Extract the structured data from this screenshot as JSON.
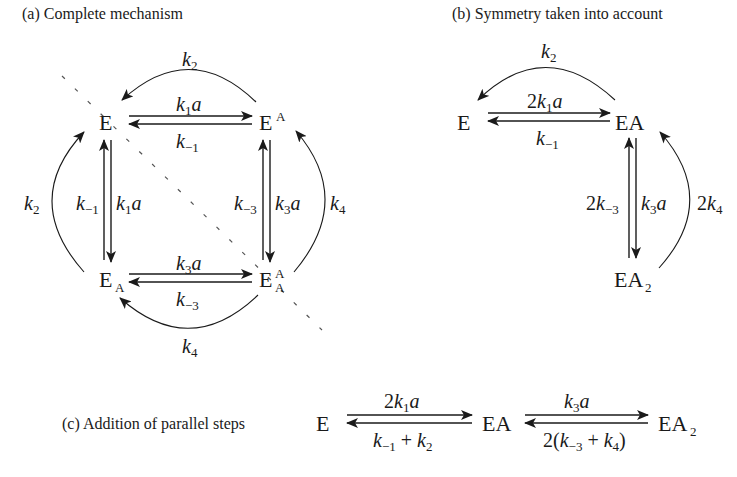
{
  "panels": {
    "a": {
      "caption": "(a) Complete mechanism",
      "species": {
        "E": "E",
        "EA_top": {
          "base": "E",
          "sup": "A"
        },
        "EA_bottom": {
          "base": "E",
          "sub": "A"
        },
        "EAA": {
          "base": "E",
          "sup": "A",
          "sub": "A"
        }
      },
      "labels": {
        "top_arc": {
          "k": "k",
          "sub": "2"
        },
        "top_fwd": {
          "k": "k",
          "sub": "1",
          "tail": "a"
        },
        "top_rev": {
          "k": "k",
          "sub": "−1"
        },
        "left_arc": {
          "k": "k",
          "sub": "2"
        },
        "left_rev": {
          "k": "k",
          "sub": "−1"
        },
        "left_fwd": {
          "k": "k",
          "sub": "1",
          "tail": "a"
        },
        "right_rev": {
          "k": "k",
          "sub": "−3"
        },
        "right_fwd": {
          "k": "k",
          "sub": "3",
          "tail": "a"
        },
        "right_arc": {
          "k": "k",
          "sub": "4"
        },
        "bottom_fwd": {
          "k": "k",
          "sub": "3",
          "tail": "a"
        },
        "bottom_rev": {
          "k": "k",
          "sub": "−3"
        },
        "bottom_arc": {
          "k": "k",
          "sub": "4"
        }
      }
    },
    "b": {
      "caption": "(b) Symmetry taken into account",
      "species": {
        "E": "E",
        "EA": "EA",
        "EA2": {
          "base": "EA",
          "sub": "2"
        }
      },
      "labels": {
        "top_arc": {
          "k": "k",
          "sub": "2"
        },
        "fwd": {
          "pre": "2",
          "k": "k",
          "sub": "1",
          "tail": "a"
        },
        "rev": {
          "k": "k",
          "sub": "−1"
        },
        "down_rev": {
          "pre": "2",
          "k": "k",
          "sub": "−3"
        },
        "down_fwd": {
          "k": "k",
          "sub": "3",
          "tail": "a"
        },
        "right_arc": {
          "pre": "2",
          "k": "k",
          "sub": "4"
        }
      }
    },
    "c": {
      "caption": "(c) Addition of parallel steps",
      "species": {
        "E": "E",
        "EA": "EA",
        "EA2": {
          "base": "EA",
          "sub": "2"
        }
      },
      "labels": {
        "step1_fwd": {
          "pre": "2",
          "k": "k",
          "sub": "1",
          "tail": "a"
        },
        "step1_rev": {
          "k1": "k",
          "sub1": "−1",
          "plus": " + ",
          "k2": "k",
          "sub2": "2"
        },
        "step2_fwd": {
          "k": "k",
          "sub": "3",
          "tail": "a"
        },
        "step2_rev": {
          "pre": "2(",
          "k1": "k",
          "sub1": "−3",
          "plus": " + ",
          "k2": "k",
          "sub2": "4",
          "post": ")"
        }
      }
    }
  }
}
